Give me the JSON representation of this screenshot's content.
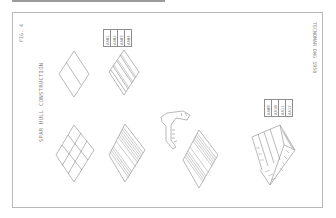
{
  "figure": {
    "label": "FIG. 4",
    "title": "SPAR HULL CONSTRUCTION",
    "drawing_ref": "TECNOMAR DWG 1958"
  },
  "label_tables": [
    {
      "cells": [
        "AA01",
        "AA02",
        "AA03",
        "AA04"
      ]
    },
    {
      "cells": [
        "AA09",
        "AA10",
        "AA11",
        "AA12"
      ]
    }
  ],
  "components": [
    {
      "id": "flat-panel-2",
      "desc": "plate panel divided in two"
    },
    {
      "id": "stiffened-panel-4",
      "desc": "panel with longitudinal stiffeners"
    },
    {
      "id": "flat-panel-9",
      "desc": "plate panel divided in 3x3 grid"
    },
    {
      "id": "stiffened-panel-dense",
      "desc": "densely stiffened panel"
    },
    {
      "id": "ring-frame",
      "desc": "curved ring frame segment"
    },
    {
      "id": "stiffened-panel-dense-2",
      "desc": "densely stiffened panel"
    },
    {
      "id": "hull-module",
      "desc": "assembled curved hull module"
    }
  ],
  "colors": {
    "line": "#8a8a8a",
    "frame": "#b8b8b8",
    "background": "#ffffff"
  }
}
